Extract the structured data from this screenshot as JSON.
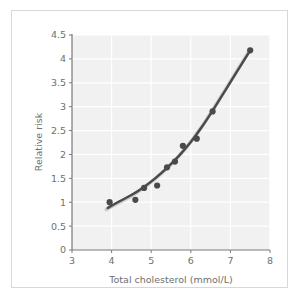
{
  "chart_data": {
    "type": "scatter",
    "title": "",
    "xlabel": "Total cholesterol (mmol/L)",
    "ylabel": "Relative risk",
    "xlim": [
      3,
      8
    ],
    "ylim": [
      0,
      4.5
    ],
    "xticks": [
      "3",
      "4",
      "5",
      "6",
      "7",
      "8"
    ],
    "xtick_values": [
      3,
      4,
      5,
      6,
      7,
      8
    ],
    "yticks": [
      "0",
      "0.5",
      "1",
      "1.5",
      "2",
      "2.5",
      "3",
      "3.5",
      "4",
      "4.5"
    ],
    "ytick_values": [
      0,
      0.5,
      1,
      1.5,
      2,
      2.5,
      3,
      3.5,
      4,
      4.5
    ],
    "grid": true,
    "legend": "none",
    "plot_background": "#f1f1f1",
    "gridline_color": "#ffffff",
    "marker_color": "#4a4a4a",
    "line_color": "#4a4a4a",
    "series": [
      {
        "name": "Observed relative risk",
        "type": "scatter",
        "x": [
          3.95,
          4.6,
          4.82,
          5.15,
          5.4,
          5.6,
          5.8,
          6.15,
          6.55,
          7.5
        ],
        "y": [
          1.0,
          1.05,
          1.3,
          1.35,
          1.73,
          1.85,
          2.18,
          2.33,
          2.9,
          4.18
        ]
      },
      {
        "name": "Fitted curve",
        "type": "line",
        "x": [
          3.9,
          4.2,
          4.5,
          4.8,
          5.1,
          5.4,
          5.7,
          6.0,
          6.3,
          6.6,
          6.9,
          7.2,
          7.5
        ],
        "y": [
          0.88,
          1.02,
          1.15,
          1.31,
          1.5,
          1.72,
          1.97,
          2.26,
          2.6,
          2.98,
          3.38,
          3.78,
          4.18
        ]
      }
    ]
  }
}
